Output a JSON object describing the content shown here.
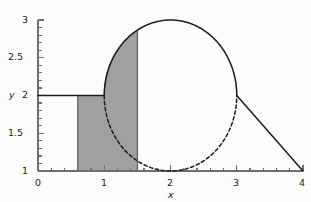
{
  "figure": {
    "background_color": "#fdfdfd",
    "width": 311,
    "height": 202
  },
  "chart_data": {
    "type": "line",
    "title": "",
    "subtitle": "",
    "xlabel": "x",
    "ylabel": "y",
    "xlim": [
      0,
      4
    ],
    "ylim": [
      1,
      3
    ],
    "grid": false,
    "legend": null,
    "x_ticks_major": [
      0,
      1,
      2,
      3,
      4
    ],
    "x_tick_labels": [
      "0",
      "1",
      "2",
      "3",
      "4"
    ],
    "x_minor_tick_step": 0.2,
    "y_ticks_major": [
      1,
      1.5,
      2,
      2.5,
      3
    ],
    "y_tick_labels": [
      "1",
      "1.5",
      "2",
      "2.5",
      "3"
    ],
    "y_minor_tick_step": 0.1,
    "series": [
      {
        "name": "circle-upper-arc",
        "style": "solid",
        "color": "#1b1b1b",
        "description": "Upper half of circle centered (2,2) radius 1",
        "center": [
          2,
          2
        ],
        "radius": 1,
        "x": [
          1.0,
          1.1,
          1.2,
          1.3,
          1.4,
          1.5,
          1.6,
          1.7,
          1.8,
          1.9,
          2.0,
          2.1,
          2.2,
          2.3,
          2.4,
          2.5,
          2.6,
          2.7,
          2.8,
          2.9,
          3.0
        ],
        "y": [
          2.0,
          2.436,
          2.6,
          2.714,
          2.8,
          2.866,
          2.917,
          2.954,
          2.98,
          2.995,
          3.0,
          2.995,
          2.98,
          2.954,
          2.917,
          2.866,
          2.8,
          2.714,
          2.6,
          2.436,
          2.0
        ]
      },
      {
        "name": "circle-lower-arc",
        "style": "dashed",
        "color": "#1b1b1b",
        "description": "Lower half of circle centered (2,2) radius 1",
        "center": [
          2,
          2
        ],
        "radius": 1,
        "x": [
          1.0,
          1.1,
          1.2,
          1.3,
          1.4,
          1.5,
          1.6,
          1.7,
          1.8,
          1.9,
          2.0,
          2.1,
          2.2,
          2.3,
          2.4,
          2.5,
          2.6,
          2.7,
          2.8,
          2.9,
          3.0
        ],
        "y": [
          2.0,
          1.564,
          1.4,
          1.286,
          1.2,
          1.134,
          1.083,
          1.046,
          1.02,
          1.005,
          1.0,
          1.005,
          1.02,
          1.046,
          1.083,
          1.134,
          1.2,
          1.286,
          1.4,
          1.564,
          2.0
        ]
      },
      {
        "name": "horizontal-line",
        "style": "solid",
        "color": "#1b1b1b",
        "description": "Horizontal line y=2 from x=0 to circle",
        "x": [
          0,
          1.0
        ],
        "y": [
          2,
          2
        ]
      },
      {
        "name": "descending-line",
        "style": "solid",
        "color": "#1b1b1b",
        "description": "Straight line from (3,2) to (4,1)",
        "x": [
          3,
          4
        ],
        "y": [
          2,
          1
        ]
      }
    ],
    "shaded_region": {
      "name": "shaded-area",
      "fill_color": "#a0a0a0",
      "edge_color": "#4a4a4a",
      "x_start": 0.6,
      "x_end": 1.5,
      "y_bottom": 1,
      "top_boundary": "min(upper circle arc, y=2 left of x=1)",
      "top_y_at_x_end": 2.866
    },
    "annotations": []
  },
  "axis_labels": {
    "x_title": "x",
    "y_title": "y"
  }
}
